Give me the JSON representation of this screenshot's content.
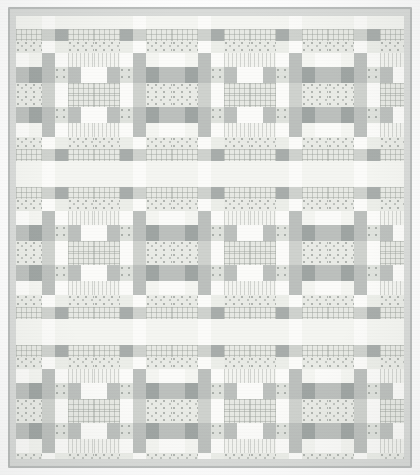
{
  "image": {
    "subject": "patchwork-quilt",
    "title": "Grey and white patchwork quilt",
    "description": "A square pieced quilt photographed flat, built from a repeating four-patch / courthouse-steps block in grey, white and cream printed cottons.",
    "width_px": 420,
    "height_px": 475,
    "background_color": "#fdfdfd"
  },
  "quilt": {
    "binding": {
      "label": "binding",
      "color": "#b9bcbb",
      "thickness_px": 2
    },
    "border": {
      "label": "border",
      "color": "#d9dbd9",
      "width_px": 6
    },
    "field": {
      "label": "pieced-field",
      "color": "#f2f3f1"
    },
    "layout": {
      "block_columns": 5,
      "block_rows": 6,
      "block_width_px": 78,
      "block_height_px": 79,
      "sashing": "integrated"
    }
  },
  "palette": [
    {
      "name": "white",
      "hex": "#fbfbf9"
    },
    {
      "name": "cream",
      "hex": "#f4f5f1"
    },
    {
      "name": "pale",
      "hex": "#eceee9"
    },
    {
      "name": "light",
      "hex": "#e2e4e0"
    },
    {
      "name": "mid",
      "hex": "#cfd2ce"
    },
    {
      "name": "grey",
      "hex": "#bcc0bd"
    },
    {
      "name": "dark",
      "hex": "#a8adab"
    },
    {
      "name": "deep",
      "hex": "#9fa5a3"
    }
  ],
  "fabrics": [
    {
      "name": "solid-white",
      "class": "f-white"
    },
    {
      "name": "solid-cream",
      "class": "f-cream"
    },
    {
      "name": "solid-pale",
      "class": "f-pale"
    },
    {
      "name": "solid-light",
      "class": "f-light"
    },
    {
      "name": "solid-mid",
      "class": "f-mid"
    },
    {
      "name": "solid-grey",
      "class": "f-grey"
    },
    {
      "name": "solid-dark",
      "class": "f-dark"
    },
    {
      "name": "plaid-light",
      "class": "f-plaid"
    },
    {
      "name": "plaid-grey",
      "class": "f-plaid2"
    },
    {
      "name": "dotted-light",
      "class": "f-dot"
    },
    {
      "name": "dotted-grey",
      "class": "f-dot2"
    },
    {
      "name": "stripe-vertical",
      "class": "f-stripe"
    },
    {
      "name": "stripe-horizontal",
      "class": "f-stripeh"
    }
  ],
  "block": {
    "name": "courthouse-steps-variation",
    "unit_px": 78,
    "patches": [
      {
        "name": "top-sash-left",
        "fabric": "f-cream",
        "x": 0,
        "y": 0,
        "w": 26,
        "h": 13
      },
      {
        "name": "top-sash-mid",
        "fabric": "f-white",
        "x": 26,
        "y": 0,
        "w": 13,
        "h": 13
      },
      {
        "name": "top-sash-right",
        "fabric": "f-cream",
        "x": 39,
        "y": 0,
        "w": 39,
        "h": 13
      },
      {
        "name": "plaid-band-left",
        "fabric": "f-plaid",
        "x": 0,
        "y": 13,
        "w": 26,
        "h": 12
      },
      {
        "name": "plaid-band-post",
        "fabric": "f-mid",
        "x": 26,
        "y": 13,
        "w": 13,
        "h": 12
      },
      {
        "name": "plaid-band-dark",
        "fabric": "f-dark",
        "x": 39,
        "y": 13,
        "w": 13,
        "h": 12
      },
      {
        "name": "plaid-band-right",
        "fabric": "f-plaid",
        "x": 52,
        "y": 13,
        "w": 26,
        "h": 12
      },
      {
        "name": "dot-band-left",
        "fabric": "f-dot",
        "x": 0,
        "y": 25,
        "w": 26,
        "h": 12
      },
      {
        "name": "dot-band-white",
        "fabric": "f-white",
        "x": 26,
        "y": 25,
        "w": 13,
        "h": 12
      },
      {
        "name": "dot-band-pale",
        "fabric": "f-pale",
        "x": 39,
        "y": 25,
        "w": 13,
        "h": 12
      },
      {
        "name": "dot-band-right",
        "fabric": "f-dot",
        "x": 52,
        "y": 25,
        "w": 26,
        "h": 12
      },
      {
        "name": "left-arm-upper",
        "fabric": "f-white",
        "x": 0,
        "y": 37,
        "w": 13,
        "h": 13
      },
      {
        "name": "left-arm-cream",
        "fabric": "f-cream",
        "x": 13,
        "y": 37,
        "w": 13,
        "h": 13
      },
      {
        "name": "center-post-top",
        "fabric": "f-grey",
        "x": 26,
        "y": 37,
        "w": 13,
        "h": 29
      },
      {
        "name": "center-white-top",
        "fabric": "f-white",
        "x": 39,
        "y": 37,
        "w": 13,
        "h": 13
      },
      {
        "name": "right-arm-upper",
        "fabric": "f-stripe",
        "x": 52,
        "y": 37,
        "w": 26,
        "h": 13
      },
      {
        "name": "left-dark-square",
        "fabric": "f-grey",
        "x": 0,
        "y": 50,
        "w": 13,
        "h": 16
      },
      {
        "name": "left-deep-square",
        "fabric": "f-deep",
        "x": 13,
        "y": 50,
        "w": 13,
        "h": 16
      },
      {
        "name": "center-dot",
        "fabric": "f-dot2",
        "x": 39,
        "y": 50,
        "w": 13,
        "h": 16
      },
      {
        "name": "right-grey",
        "fabric": "f-grey",
        "x": 52,
        "y": 50,
        "w": 13,
        "h": 16
      },
      {
        "name": "right-white",
        "fabric": "f-white",
        "x": 65,
        "y": 50,
        "w": 13,
        "h": 16
      },
      {
        "name": "bottom-sash-left",
        "fabric": "f-dot",
        "x": 0,
        "y": 66,
        "w": 26,
        "h": 12
      },
      {
        "name": "bottom-post",
        "fabric": "f-mid",
        "x": 26,
        "y": 66,
        "w": 13,
        "h": 12
      },
      {
        "name": "bottom-white",
        "fabric": "f-white",
        "x": 39,
        "y": 66,
        "w": 13,
        "h": 12
      },
      {
        "name": "bottom-sash-right",
        "fabric": "f-plaid",
        "x": 52,
        "y": 66,
        "w": 26,
        "h": 12
      }
    ]
  }
}
